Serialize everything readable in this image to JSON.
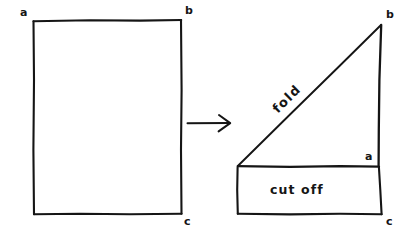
{
  "diagram": {
    "background_color": "#ffffff",
    "ink_color": "#151515",
    "left_figure": {
      "name": "original rectangle",
      "shape": "rectangle",
      "vertex_labels": {
        "top_left": "a",
        "top_right": "b",
        "bottom_right": "c"
      }
    },
    "transition": {
      "glyph": "arrow-right"
    },
    "right_figure": {
      "name": "folded triangle with cut off strip",
      "shape": "right-triangle-over-rectangle",
      "vertex_labels": {
        "apex_top": "b",
        "inner_right_angle": "a",
        "bottom_right": "c"
      },
      "annotations": {
        "hypotenuse": "fold",
        "strip": "cut off"
      }
    }
  }
}
